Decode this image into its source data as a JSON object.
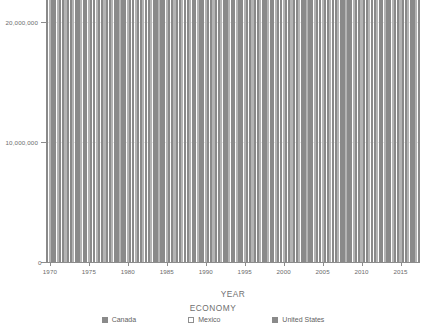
{
  "chart_data": {
    "type": "bar",
    "title": "",
    "xlabel": "YEAR",
    "ylabel": "",
    "legend_title": "ECONOMY",
    "legend_position": "bottom",
    "grid": true,
    "ylim": [
      0,
      20000000
    ],
    "y_ticks": [
      "0",
      "10,000,000",
      "20,000,000"
    ],
    "y_tick_values": [
      0,
      10000000,
      20000000
    ],
    "x_ticks": [
      "1970",
      "1975",
      "1980",
      "1985",
      "1990",
      "1995",
      "2000",
      "2005",
      "2010",
      "2015"
    ],
    "x_tick_values": [
      1970,
      1975,
      1980,
      1985,
      1990,
      1995,
      2000,
      2005,
      2010,
      2015
    ],
    "x": [
      1970,
      1971,
      1972,
      1973,
      1974,
      1975,
      1976,
      1977,
      1978,
      1979,
      1980,
      1981,
      1982,
      1983,
      1984,
      1985,
      1986,
      1987,
      1988,
      1989,
      1990,
      1991,
      1992,
      1993,
      1994,
      1995,
      1996,
      1997,
      1998,
      1999,
      2000,
      2001,
      2002,
      2003,
      2004,
      2005,
      2006,
      2007,
      2008,
      2009,
      2010,
      2011,
      2012,
      2013,
      2014,
      2015,
      2016,
      2017
    ],
    "series": [
      {
        "name": "Canada",
        "color": "#8a8a8a",
        "values": [
          89000000,
          101000000,
          115000000,
          134000000,
          161000000,
          176000000,
          206000000,
          212000000,
          219000000,
          244000000,
          274000000,
          307000000,
          314000000,
          341000000,
          356000000,
          365000000,
          378000000,
          425000000,
          506000000,
          565000000,
          596000000,
          611000000,
          592000000,
          577000000,
          578000000,
          604000000,
          636000000,
          653000000,
          634000000,
          676000000,
          742000000,
          736000000,
          762000000,
          895000000,
          1023000000,
          1169000000,
          1315000000,
          1464000000,
          1549000000,
          1371000000,
          1613000000,
          1789000000,
          1824000000,
          1843000000,
          1799000000,
          1556000000,
          1528000000,
          1649000000
        ]
      },
      {
        "name": "Mexico",
        "color": "#b4b4b4",
        "values": [
          35000000,
          39000000,
          45000000,
          55000000,
          72000000,
          89000000,
          94000000,
          81000000,
          103000000,
          135000000,
          195000000,
          250000000,
          176000000,
          149000000,
          176000000,
          184000000,
          129000000,
          141000000,
          183000000,
          223000000,
          262000000,
          314000000,
          363000000,
          500000000,
          527000000,
          360000000,
          401000000,
          480000000,
          519000000,
          579000000,
          683000000,
          724000000,
          741000000,
          713000000,
          770000000,
          866000000,
          966000000,
          1043000000,
          1100000000,
          894000000,
          1057000000,
          1180000000,
          1201000000,
          1274000000,
          1314000000,
          1171000000,
          1078000000,
          1158000000
        ]
      },
      {
        "name": "United States",
        "color": "#8a8a8a",
        "values": [
          1073000000,
          1165000000,
          1279000000,
          1425000000,
          1545000000,
          1685000000,
          1873000000,
          2082000000,
          2352000000,
          2627000000,
          2857000000,
          3207000000,
          3344000000,
          3634000000,
          4038000000,
          4339000000,
          4580000000,
          4855000000,
          5236000000,
          5642000000,
          5963000000,
          6158000000,
          6520000000,
          6859000000,
          7287000000,
          7640000000,
          8073000000,
          8578000000,
          9063000000,
          9631000000,
          10252000000,
          10582000000,
          10936000000,
          11458000000,
          12214000000,
          13037000000,
          13815000000,
          14452000000,
          14713000000,
          14449000000,
          14992000000,
          15543000000,
          16197000000,
          16785000000,
          17527000000,
          18225000000,
          18715000000,
          19519000000
        ]
      }
    ]
  }
}
